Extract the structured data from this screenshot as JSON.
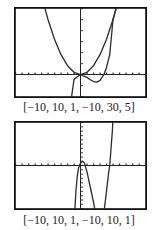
{
  "chart_data": [
    {
      "type": "line",
      "title": "",
      "caption": "[−10, 10, 1, −10, 30, 5]",
      "window": {
        "xmin": -10,
        "xmax": 10,
        "xscl": 1,
        "ymin": -10,
        "ymax": 30,
        "yscl": 5
      },
      "xlim": [
        -10,
        10
      ],
      "ylim": [
        -10,
        30
      ],
      "grid": false,
      "series": [
        {
          "name": "parabola",
          "points": [
            [
              -5.6,
              31.4
            ],
            [
              -5,
              25
            ],
            [
              -4,
              16
            ],
            [
              -3,
              9
            ],
            [
              -2,
              4
            ],
            [
              -1,
              1
            ],
            [
              0,
              0
            ],
            [
              1,
              1
            ],
            [
              2,
              4
            ],
            [
              3,
              9
            ],
            [
              4,
              16
            ],
            [
              5,
              25
            ],
            [
              5.6,
              31.4
            ]
          ]
        },
        {
          "name": "cubic",
          "points": [
            [
              -1.8,
              -17.5
            ],
            [
              -1.5,
              -12.8
            ],
            [
              -1,
              -2.3
            ],
            [
              -0.5,
              -1.03
            ],
            [
              0,
              0
            ],
            [
              0.5,
              -0.78
            ],
            [
              1,
              -1.3
            ],
            [
              1.5,
              -2.36
            ],
            [
              2,
              -3.2
            ],
            [
              2.5,
              -3.44
            ],
            [
              3,
              -2.7
            ],
            [
              3.6,
              0
            ],
            [
              4,
              3.2
            ],
            [
              4.5,
              9.1
            ],
            [
              5,
              25
            ],
            [
              5.3,
              28
            ],
            [
              5.6,
              31.4
            ]
          ]
        }
      ]
    },
    {
      "type": "line",
      "title": "",
      "caption": "[−10, 10, 1, −10, 10, 1]",
      "window": {
        "xmin": -10,
        "xmax": 10,
        "xscl": 1,
        "ymin": -10,
        "ymax": 10,
        "yscl": 1
      },
      "xlim": [
        -10,
        10
      ],
      "ylim": [
        -10,
        10
      ],
      "grid": false,
      "series": [
        {
          "name": "curve",
          "points": [
            [
              -0.9,
              -11
            ],
            [
              -0.7,
              -6
            ],
            [
              -0.5,
              -2.5
            ],
            [
              -0.3,
              -0.6
            ],
            [
              0,
              0.6
            ],
            [
              0.3,
              1.0
            ],
            [
              0.6,
              0.6
            ],
            [
              1.0,
              -1.5
            ],
            [
              1.5,
              -5
            ],
            [
              2.0,
              -8.5
            ],
            [
              2.3,
              -11
            ]
          ]
        },
        {
          "name": "curve-right",
          "points": [
            [
              3.6,
              -11
            ],
            [
              4.0,
              -6
            ],
            [
              4.3,
              -2
            ],
            [
              4.5,
              0
            ],
            [
              4.7,
              4
            ],
            [
              4.9,
              8
            ],
            [
              5.0,
              11
            ]
          ]
        }
      ]
    }
  ],
  "captions": {
    "top": "[−10, 10, 1, −10, 30, 5]",
    "bottom": "[−10, 10, 1, −10, 10, 1]"
  }
}
